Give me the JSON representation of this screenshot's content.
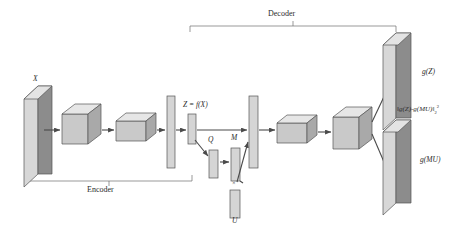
{
  "figure": {
    "background_color": "#ffffff",
    "line_color": "#4a4a4a",
    "face_front_color": "#8f8f8f",
    "face_top_color": "#d9d9d9",
    "face_side_color": "#c6c6c6",
    "bar_color": "#d5d5d5"
  },
  "brackets": {
    "decoder": {
      "label": "Decoder",
      "x_start": 190,
      "x_end": 396,
      "y": 26
    },
    "encoder": {
      "label": "Encoder",
      "x_start": 27,
      "x_end": 192,
      "y": 181
    }
  },
  "labels": {
    "input_plane": "X",
    "latent_code": "Z = f(X)",
    "matrix_q": "Q",
    "matrix_m": "M",
    "matrix_u": "U",
    "multiply_symbol": "×",
    "output_top": "g(Z)",
    "output_bottom": "g(MU)",
    "loss_prefix": "‖g(Z)-g(MU)‖",
    "loss_sub": "2",
    "loss_sup": "2"
  },
  "encoder_blocks": [
    {
      "name": "input-plane",
      "type": "plane",
      "x": 30,
      "y": 72,
      "w": 38,
      "h": 98
    },
    {
      "name": "conv-block-1",
      "type": "cube",
      "x": 62,
      "y": 104,
      "w": 30,
      "h": 30
    },
    {
      "name": "conv-block-2",
      "type": "cube",
      "x": 112,
      "y": 113,
      "w": 34,
      "h": 20
    },
    {
      "name": "dense-bar-1",
      "type": "bar",
      "x": 162,
      "y": 96,
      "w": 8,
      "h": 72
    }
  ],
  "bottleneck": {
    "latent_bar": {
      "x": 187,
      "y": 113,
      "w": 7,
      "h": 28
    },
    "q_bar": {
      "x": 206,
      "y": 145,
      "w": 8,
      "h": 28
    },
    "m_bar": {
      "x": 228,
      "y": 143,
      "w": 8,
      "h": 35
    },
    "u_bar": {
      "x": 228,
      "y": 184,
      "w": 9,
      "h": 28
    }
  },
  "decoder_blocks": [
    {
      "name": "dense-bar-2",
      "type": "bar",
      "x": 249,
      "y": 96,
      "w": 8,
      "h": 72
    },
    {
      "name": "deconv-block-1",
      "type": "cube",
      "x": 277,
      "y": 115,
      "w": 34,
      "h": 20
    },
    {
      "name": "deconv-block-2",
      "type": "cube",
      "x": 332,
      "y": 107,
      "w": 32,
      "h": 32
    },
    {
      "name": "output-plane-top",
      "type": "plane",
      "x": 383,
      "y": 27,
      "w": 34,
      "h": 92
    },
    {
      "name": "output-plane-bottom",
      "type": "plane",
      "x": 383,
      "y": 118,
      "w": 34,
      "h": 85
    }
  ]
}
